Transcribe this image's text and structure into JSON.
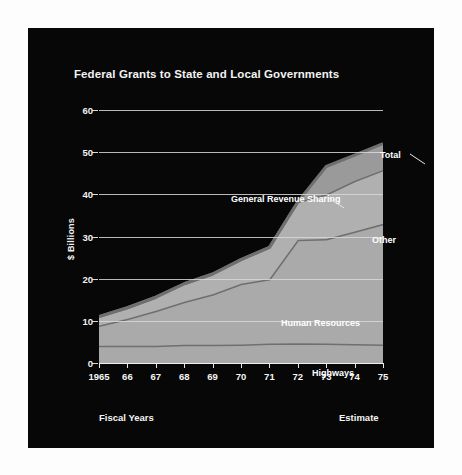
{
  "panel": {
    "background_color": "#070707",
    "page_background_color": "#ffffff"
  },
  "chart_data": {
    "type": "area",
    "title": "Federal Grants to State and Local Governments",
    "subtitle": "",
    "xlabel": "Fiscal Years",
    "ylabel": "$ Billions",
    "note_right": "Estimate",
    "stacked": true,
    "grid": true,
    "legend_position": "inline-annotations",
    "xlim": [
      1965,
      1975
    ],
    "ylim": [
      0,
      60
    ],
    "yticks": [
      0,
      10,
      20,
      30,
      40,
      50,
      60
    ],
    "ytick_labels": [
      "0",
      "10",
      "20",
      "30",
      "40",
      "50",
      "60"
    ],
    "x": [
      1965,
      1966,
      1967,
      1968,
      1969,
      1970,
      1971,
      1972,
      1973,
      1974,
      1975
    ],
    "categories": [
      "1965",
      "66",
      "67",
      "68",
      "69",
      "70",
      "71",
      "72",
      "73",
      "74",
      "75"
    ],
    "series": [
      {
        "name": "Highways",
        "label": "Highways",
        "color": "#a9a9a9",
        "line_color": "#6f6f6f",
        "values": [
          4.1,
          4.1,
          4.1,
          4.3,
          4.3,
          4.4,
          4.6,
          4.7,
          4.6,
          4.5,
          4.4
        ]
      },
      {
        "name": "Human Resources",
        "label": "Human Resources",
        "color": "#aaaaaa",
        "line_color": "#6f6f6f",
        "values": [
          4.8,
          6.4,
          8.3,
          10.2,
          12.0,
          14.4,
          15.3,
          24.5,
          24.8,
          26.7,
          28.6
        ]
      },
      {
        "name": "Other",
        "label": "Other",
        "color": "#b0b0b0",
        "line_color": "#6f6f6f",
        "values": [
          2.1,
          2.6,
          3.2,
          4.3,
          4.8,
          5.7,
          7.5,
          9.0,
          10.6,
          12.0,
          12.8
        ]
      },
      {
        "name": "General Revenue Sharing",
        "label": "General Revenue Sharing",
        "color": "#9a9a9a",
        "line_color": "#6f6f6f",
        "values": [
          0,
          0,
          0,
          0,
          0,
          0,
          0,
          0,
          6.6,
          6.1,
          6.2
        ]
      }
    ],
    "total": {
      "name": "Total",
      "label": "Total",
      "values": [
        11.0,
        13.1,
        15.6,
        18.8,
        21.1,
        24.5,
        27.4,
        38.2,
        46.6,
        49.3,
        52.0
      ]
    },
    "annotations": [
      {
        "label": "Total",
        "x_px": 352,
        "y_px": 128
      },
      {
        "label": "General Revenue Sharing",
        "x_px": 203,
        "y_px": 172
      },
      {
        "label": "Other",
        "x_px": 344,
        "y_px": 213
      },
      {
        "label": "Human Resources",
        "x_px": 253,
        "y_px": 296
      },
      {
        "label": "Highways",
        "x_px": 284,
        "y_px": 346
      }
    ]
  }
}
